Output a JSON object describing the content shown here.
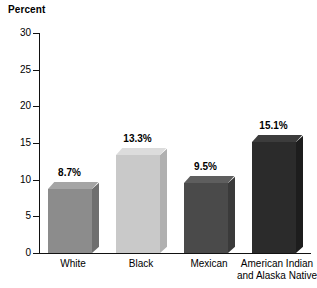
{
  "chart_data": {
    "type": "bar",
    "title": "",
    "ylabel": "Percent",
    "xlabel": "",
    "ylim": [
      0,
      30
    ],
    "yticks": [
      0,
      5,
      10,
      15,
      20,
      25,
      30
    ],
    "grid": false,
    "legend": "none",
    "categories": [
      "White",
      "Black",
      "Mexican",
      "American Indian and Alaska Native"
    ],
    "category_lines": [
      [
        "White"
      ],
      [
        "Black"
      ],
      [
        "Mexican"
      ],
      [
        "American Indian",
        "and Alaska Native"
      ]
    ],
    "values": [
      8.7,
      13.3,
      9.5,
      15.1
    ],
    "data_labels": [
      "8.7%",
      "13.3%",
      "9.5%",
      "15.1%"
    ],
    "bar_colors": [
      "#8c8c8c",
      "#c9c9c9",
      "#4a4a4a",
      "#2b2b2b"
    ],
    "bar_top_colors": [
      "#a5a5a5",
      "#dcdcdc",
      "#5e5e5e",
      "#3c3c3c"
    ],
    "bar_side_colors": [
      "#6f6f6f",
      "#b0b0b0",
      "#3a3a3a",
      "#1d1d1d"
    ],
    "style": "3d-column"
  },
  "colors": {
    "axis": "#111111",
    "text": "#000000",
    "background": "#ffffff"
  }
}
